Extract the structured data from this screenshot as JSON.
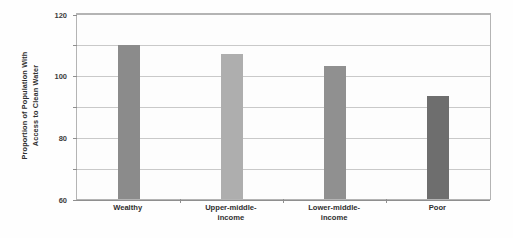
{
  "chart_data": {
    "type": "bar",
    "title": "",
    "xlabel": "",
    "ylabel": "Proportion of Population With Access to Clean Water",
    "ylabel_lines": [
      "Proportion of Population With",
      "Access to Clean Water"
    ],
    "categories": [
      "Wealthy",
      "Upper-middle-income",
      "Lower-middle-income",
      "Poor"
    ],
    "category_lines": [
      [
        "Wealthy"
      ],
      [
        "Upper-middle-",
        "income"
      ],
      [
        "Lower-middle-",
        "income"
      ],
      [
        "Poor"
      ]
    ],
    "values": [
      100,
      94,
      86,
      67
    ],
    "ylim": [
      0,
      120
    ],
    "ytick_values": [
      0,
      20,
      40,
      60,
      80,
      100,
      120
    ],
    "ytick_labels": [
      "0",
      "20",
      "40",
      "60",
      "80",
      "100",
      "120"
    ],
    "grid": true,
    "legend": false,
    "bar_colors": [
      "#8b8b8b",
      "#aeaeae",
      "#909090",
      "#6e6e6e"
    ],
    "colors": {
      "axis": "#8f8f8f",
      "gridline": "#c9c9c9",
      "frame": "#b4b4b4",
      "text": "#2f2f2f",
      "background": "#fefefe"
    }
  }
}
